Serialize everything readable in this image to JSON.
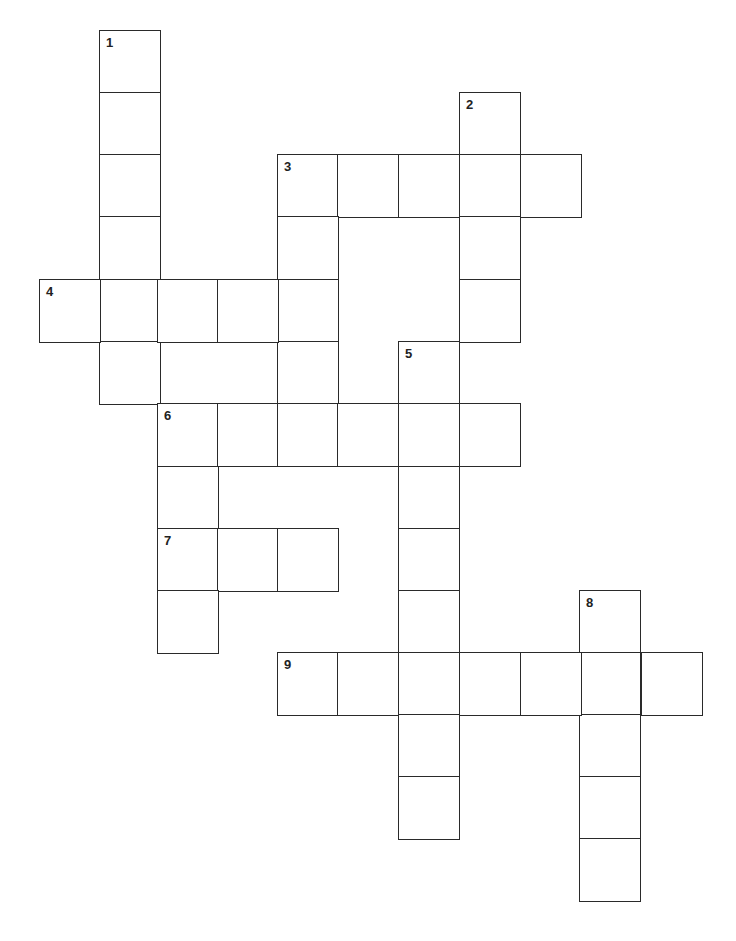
{
  "puzzle": {
    "title": "",
    "cell_w": 60,
    "cell_h": 62,
    "clue_numbers": [
      "1",
      "2",
      "3",
      "4",
      "5",
      "6",
      "7",
      "8",
      "9"
    ],
    "cells": [
      {
        "x": 99,
        "y": 30,
        "n": "1"
      },
      {
        "x": 99,
        "y": 92
      },
      {
        "x": 99,
        "y": 154
      },
      {
        "x": 99,
        "y": 216
      },
      {
        "x": 99,
        "y": 279
      },
      {
        "x": 99,
        "y": 341
      },
      {
        "x": 459,
        "y": 92,
        "n": "2"
      },
      {
        "x": 459,
        "y": 154
      },
      {
        "x": 459,
        "y": 216
      },
      {
        "x": 459,
        "y": 279
      },
      {
        "x": 277,
        "y": 154,
        "n": "3"
      },
      {
        "x": 337,
        "y": 154
      },
      {
        "x": 398,
        "y": 154
      },
      {
        "x": 520,
        "y": 154
      },
      {
        "x": 277,
        "y": 216
      },
      {
        "x": 277,
        "y": 279
      },
      {
        "x": 277,
        "y": 341
      },
      {
        "x": 39,
        "y": 279,
        "n": "4"
      },
      {
        "x": 157,
        "y": 279
      },
      {
        "x": 217,
        "y": 279
      },
      {
        "x": 398,
        "y": 341,
        "n": "5"
      },
      {
        "x": 398,
        "y": 403
      },
      {
        "x": 398,
        "y": 466
      },
      {
        "x": 398,
        "y": 528
      },
      {
        "x": 398,
        "y": 590
      },
      {
        "x": 398,
        "y": 652
      },
      {
        "x": 398,
        "y": 714
      },
      {
        "x": 398,
        "y": 776
      },
      {
        "x": 157,
        "y": 403,
        "n": "6"
      },
      {
        "x": 217,
        "y": 403
      },
      {
        "x": 277,
        "y": 403
      },
      {
        "x": 337,
        "y": 403
      },
      {
        "x": 459,
        "y": 403
      },
      {
        "x": 157,
        "y": 466
      },
      {
        "x": 157,
        "y": 528,
        "n": "7"
      },
      {
        "x": 217,
        "y": 528
      },
      {
        "x": 277,
        "y": 528
      },
      {
        "x": 157,
        "y": 590
      },
      {
        "x": 579,
        "y": 590,
        "n": "8"
      },
      {
        "x": 579,
        "y": 652
      },
      {
        "x": 579,
        "y": 714
      },
      {
        "x": 579,
        "y": 776
      },
      {
        "x": 579,
        "y": 838
      },
      {
        "x": 277,
        "y": 652,
        "n": "9"
      },
      {
        "x": 337,
        "y": 652
      },
      {
        "x": 459,
        "y": 652
      },
      {
        "x": 520,
        "y": 652
      },
      {
        "x": 641,
        "y": 652
      }
    ],
    "fillers": [
      {
        "x": 157,
        "y": 341,
        "w": 122
      }
    ]
  }
}
